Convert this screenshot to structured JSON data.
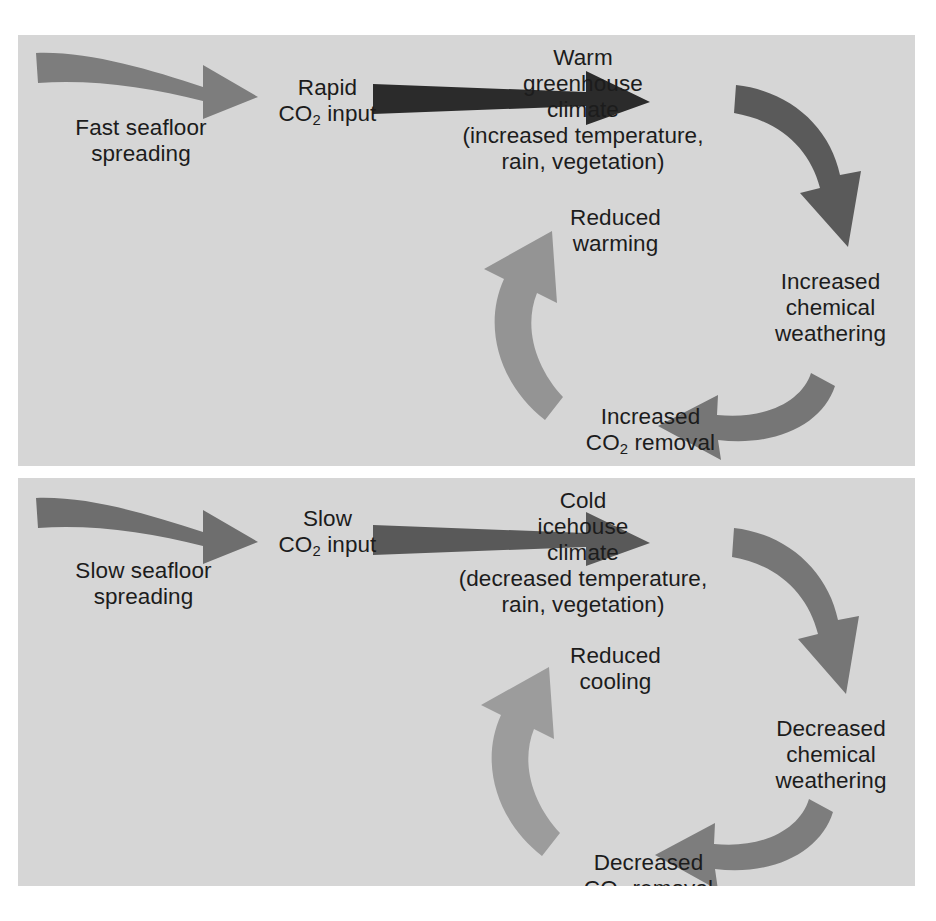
{
  "figure": {
    "background_color": "#ffffff",
    "panel_background_color": "#d6d6d6",
    "text_color": "#1c1c1c"
  },
  "panels": [
    {
      "id": "greenhouse",
      "name": "warm-greenhouse-climate-feedback-loop",
      "labels": {
        "seafloor_spreading": "Fast seafloor\nspreading",
        "co2_input_line1": "Rapid",
        "co2_input_line2_pre": "CO",
        "co2_input_sub": "2",
        "co2_input_line2_post": " input",
        "climate": "Warm\ngreenhouse\nclimate\n(increased temperature,\nrain, vegetation)",
        "chemical_weathering": "Increased\nchemical\nweathering",
        "co2_removal_line1": "Increased",
        "co2_removal_line2_pre": "CO",
        "co2_removal_sub": "2",
        "co2_removal_line2_post": " removal",
        "reduced_effect": "Reduced\nwarming"
      },
      "arrows": [
        {
          "name": "spreading-to-co2-input-arrow",
          "color": "#7d7d7d",
          "direction": "right"
        },
        {
          "name": "co2-input-to-climate-arrow",
          "color": "#2b2b2b",
          "direction": "right"
        },
        {
          "name": "climate-to-weathering-arrow",
          "color": "#5a5a5a",
          "direction": "down"
        },
        {
          "name": "weathering-to-co2-removal-arrow",
          "color": "#767676",
          "direction": "left"
        },
        {
          "name": "co2-removal-to-reduced-warming-arrow",
          "color": "#949494",
          "direction": "up"
        }
      ]
    },
    {
      "id": "icehouse",
      "name": "cold-icehouse-climate-feedback-loop",
      "labels": {
        "seafloor_spreading": "Slow seafloor\nspreading",
        "co2_input_line1": "Slow",
        "co2_input_line2_pre": "CO",
        "co2_input_sub": "2",
        "co2_input_line2_post": " input",
        "climate": "Cold\nicehouse\nclimate\n(decreased temperature,\nrain, vegetation)",
        "chemical_weathering": "Decreased\nchemical\nweathering",
        "co2_removal_line1": "Decreased",
        "co2_removal_line2_pre": "CO",
        "co2_removal_sub": "2",
        "co2_removal_line2_post": " removal",
        "reduced_effect": "Reduced\ncooling"
      },
      "arrows": [
        {
          "name": "spreading-to-co2-input-arrow",
          "color": "#6e6e6e",
          "direction": "right"
        },
        {
          "name": "co2-input-to-climate-arrow",
          "color": "#595959",
          "direction": "right"
        },
        {
          "name": "climate-to-weathering-arrow",
          "color": "#767676",
          "direction": "down"
        },
        {
          "name": "weathering-to-co2-removal-arrow",
          "color": "#7d7d7d",
          "direction": "left"
        },
        {
          "name": "co2-removal-to-reduced-cooling-arrow",
          "color": "#9c9c9c",
          "direction": "up"
        }
      ]
    }
  ]
}
